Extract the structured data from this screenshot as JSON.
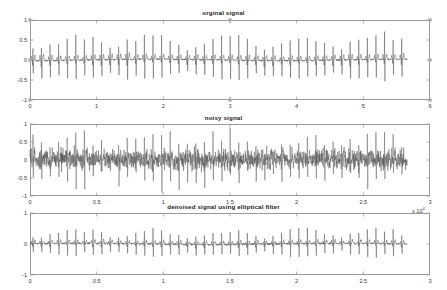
{
  "figure": {
    "background_color": "#ffffff",
    "axis_color": "#9a9a9a",
    "trace_color": "#4a4a4a",
    "width": 447,
    "height": 290
  },
  "chart_data": [
    {
      "type": "line",
      "title": "orginal signal",
      "xlabel": "",
      "ylabel": "",
      "xlim": [
        0,
        6
      ],
      "ylim": [
        -1,
        1
      ],
      "xticks": [
        "0",
        "1",
        "2",
        "3",
        "4",
        "5",
        "6"
      ],
      "xtick_values": [
        0,
        1,
        2,
        3,
        4,
        5,
        6
      ],
      "yticks": [
        "1",
        "0.5",
        "0",
        "-0.5",
        "-1"
      ],
      "ytick_values": [
        1,
        0.5,
        0,
        -0.5,
        -1
      ],
      "exponent_label": "",
      "grid": false,
      "legend": "none",
      "series": [
        {
          "name": "ECG original",
          "description": "clean ECG waveform, periodic QRS complexes",
          "data_end_x": 5.66,
          "beats": 44,
          "qrs_peak_amplitude": 0.62,
          "qrs_trough_amplitude": -0.48,
          "p_wave_amplitude": 0.1,
          "t_wave_amplitude": 0.13,
          "baseline": 0.0,
          "noise_amplitude": 0.02
        }
      ]
    },
    {
      "type": "line",
      "title": "noisy signal",
      "xlabel": "",
      "ylabel": "",
      "xlim": [
        0,
        3
      ],
      "ylim": [
        -1,
        1
      ],
      "xticks": [
        "0",
        "0.5",
        "1",
        "1.5",
        "2",
        "2.5",
        "3"
      ],
      "xtick_values": [
        0,
        0.5,
        1,
        1.5,
        2,
        2.5,
        3
      ],
      "yticks": [
        "1",
        "0.5",
        "0",
        "-0.5",
        "-1"
      ],
      "ytick_values": [
        1,
        0.5,
        0,
        -0.5,
        -1
      ],
      "exponent_label": "x 10",
      "exponent_power": "4",
      "grid": false,
      "legend": "none",
      "series": [
        {
          "name": "ECG with additive noise",
          "description": "ECG buried in dense broadband noise band",
          "data_end_x": 2.83,
          "beats": 44,
          "qrs_peak_amplitude": 0.7,
          "qrs_trough_amplitude": -0.6,
          "p_wave_amplitude": 0.1,
          "t_wave_amplitude": 0.13,
          "baseline": 0.0,
          "noise_amplitude": 0.17
        }
      ]
    },
    {
      "type": "line",
      "title": "denoised signal using elliptical filter",
      "xlabel": "",
      "ylabel": "",
      "xlim": [
        0,
        3
      ],
      "ylim": [
        -1,
        1
      ],
      "xticks": [
        "0",
        "0.5",
        "1",
        "1.5",
        "2",
        "2.5",
        "3"
      ],
      "xtick_values": [
        0,
        0.5,
        1,
        1.5,
        2,
        2.5,
        3
      ],
      "yticks": [
        "1",
        "0",
        "-1"
      ],
      "ytick_values": [
        1,
        0,
        -1
      ],
      "exponent_label": "",
      "grid": false,
      "legend": "none",
      "series": [
        {
          "name": "ECG after elliptical filter",
          "description": "recovered ECG waveform, noise largely removed",
          "data_end_x": 2.83,
          "beats": 44,
          "qrs_peak_amplitude": 0.45,
          "qrs_trough_amplitude": -0.38,
          "p_wave_amplitude": 0.08,
          "t_wave_amplitude": 0.11,
          "baseline": 0.0,
          "noise_amplitude": 0.03
        }
      ]
    }
  ]
}
